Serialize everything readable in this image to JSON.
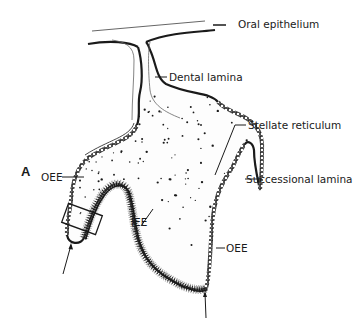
{
  "figure": {
    "panel_label": "A",
    "labels": {
      "oral_epithelium": "Oral epithelium",
      "dental_lamina": "Dental lamina",
      "stellate_reticulum": "Stellate reticulum",
      "successional_lamina": "Successional lamina",
      "oee_left": "OEE",
      "oee_right": "OEE",
      "iee": "IEE"
    },
    "colors": {
      "ink": "#1a1a1a",
      "background": "#ffffff"
    }
  }
}
